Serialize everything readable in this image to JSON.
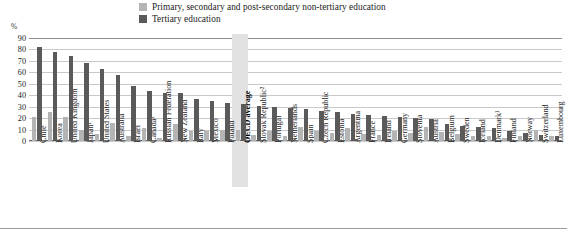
{
  "legend": {
    "items": [
      {
        "label": "Primary, secondary and post-secondary non-tertiary education",
        "color": "#b4b4b4",
        "key": "primary"
      },
      {
        "label": "Tertiary education",
        "color": "#5a5a5a",
        "key": "tertiary"
      }
    ]
  },
  "axis": {
    "unit": "%",
    "yticks": [
      "90",
      "80",
      "70",
      "60",
      "50",
      "40",
      "30",
      "20",
      "10",
      "0"
    ]
  },
  "highlight": {
    "category": "OECD average",
    "color": "#e2e2e2"
  },
  "chart_data": {
    "type": "bar",
    "title": "",
    "xlabel": "",
    "ylabel": "%",
    "ylim": [
      0,
      90
    ],
    "ytick_step": 10,
    "grid": true,
    "legend_position": "top-center",
    "categories": [
      "Chile",
      "Korea",
      "United Kingdom",
      "Japan¹",
      "United States",
      "Australia",
      "Israel",
      "Canada¹",
      "Russian Federation",
      "New Zealand",
      "Italy",
      "Mexico",
      "Poland",
      "OECD average",
      "Slovak Republic²",
      "Portugal",
      "Netherlands",
      "Spain",
      "Czech Republic",
      "Estonia",
      "Argentina",
      "France",
      "Ireland",
      "Germany",
      "Slovenia",
      "Austria",
      "Belgium",
      "Sweden",
      "Iceland",
      "Denmark¹",
      "Finland",
      "Norway",
      "Switzerland",
      "Luxembourg"
    ],
    "series": [
      {
        "name": "Primary, secondary and post-secondary non-tertiary education",
        "color": "#b4b4b4",
        "values": [
          21,
          25,
          21,
          10,
          6,
          16,
          4,
          11,
          3,
          15,
          9,
          9,
          10,
          10,
          5,
          9,
          4,
          12,
          9,
          7,
          11,
          6,
          5,
          9,
          7,
          12,
          8,
          6,
          4,
          4,
          3,
          4,
          10,
          4
        ]
      },
      {
        "name": "Tertiary education",
        "color": "#5a5a5a",
        "values": [
          82,
          78,
          74,
          68,
          63,
          58,
          48,
          44,
          42,
          42,
          37,
          35,
          33,
          32,
          31,
          30,
          29,
          28,
          26,
          25,
          24,
          23,
          22,
          21,
          20,
          19,
          15,
          13,
          12,
          11,
          9,
          7,
          5,
          4
        ]
      }
    ]
  }
}
